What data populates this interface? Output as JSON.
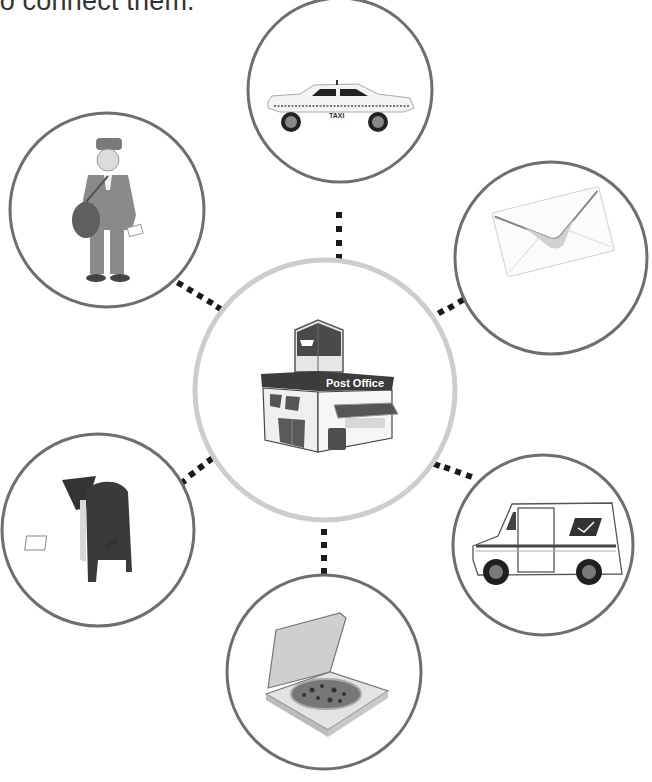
{
  "instruction": {
    "text": "to connect them."
  },
  "center": {
    "label": "Post Office",
    "icon": "post-office-building-icon",
    "cx": 325,
    "cy": 390,
    "r": 130,
    "stroke": "#cdcdcd"
  },
  "nodes": [
    {
      "id": "taxi",
      "icon": "taxi-icon",
      "label": "TAXI",
      "cx": 340,
      "cy": 90,
      "r": 92
    },
    {
      "id": "mail-carrier",
      "icon": "mail-carrier-icon",
      "cx": 107,
      "cy": 210,
      "r": 97
    },
    {
      "id": "envelope",
      "icon": "envelope-icon",
      "cx": 551,
      "cy": 258,
      "r": 96
    },
    {
      "id": "mailbox",
      "icon": "mailbox-icon",
      "cx": 98,
      "cy": 530,
      "r": 96
    },
    {
      "id": "mail-truck",
      "icon": "mail-truck-icon",
      "cx": 543,
      "cy": 545,
      "r": 90
    },
    {
      "id": "pizza-box",
      "icon": "pizza-box-icon",
      "cx": 324,
      "cy": 672,
      "r": 97
    }
  ],
  "colors": {
    "outer_stroke": "#6e6e6e",
    "center_stroke": "#cdcdcd",
    "connector": "#1a1a1a",
    "text": "#333333"
  }
}
